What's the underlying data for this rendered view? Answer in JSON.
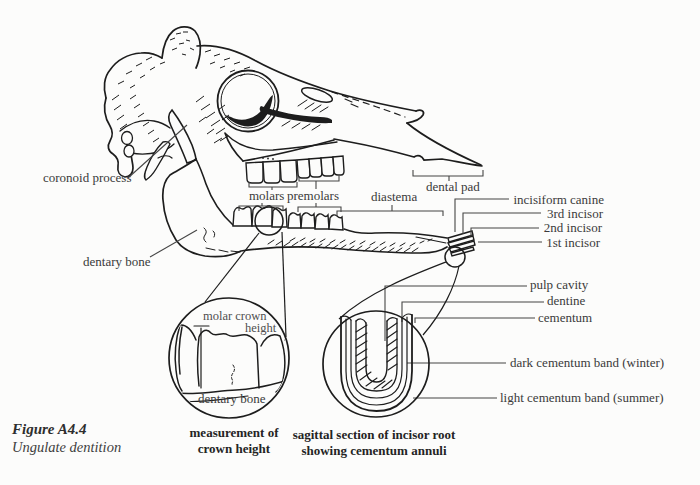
{
  "figure_caption": {
    "number": "Figure A4.4",
    "title": "Ungulate dentition"
  },
  "skull_labels": {
    "coronoid_process": "coronoid process",
    "dentary_bone": "dentary bone",
    "molars": "molars",
    "premolars": "premolars",
    "diastema": "diastema",
    "dental_pad": "dental pad",
    "incisiform_canine": "incisiform canine",
    "third_incisor": "3rd incisor",
    "second_incisor": "2nd incisor",
    "first_incisor": "1st incisor"
  },
  "crown_inset": {
    "molar_crown_line1": "molar crown",
    "molar_crown_line2": "height",
    "dentary_bone": "dentary bone",
    "caption_line1": "measurement of",
    "caption_line2": "crown height"
  },
  "root_inset": {
    "pulp_cavity": "pulp cavity",
    "dentine": "dentine",
    "cementum": "cementum",
    "dark_band": "dark cementum band (winter)",
    "light_band": "light cementum band (summer)",
    "caption_line1": "sagittal section of incisor root",
    "caption_line2": "showing cementum annuli"
  },
  "colors": {
    "ink": "#1d1d1d",
    "label_text": "#3a3a3a",
    "background": "#fcfcfb"
  }
}
